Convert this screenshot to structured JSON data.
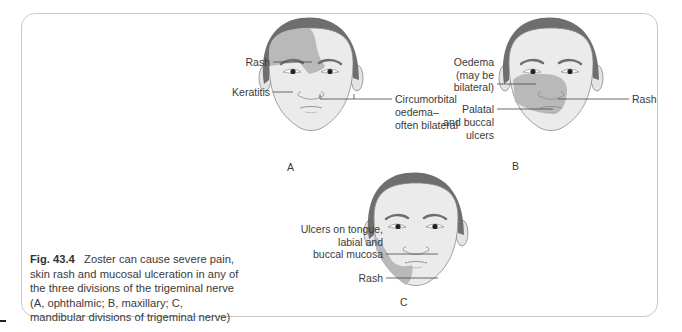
{
  "figure": {
    "number": "Fig. 43.4",
    "caption_text": "Zoster can cause severe pain, skin rash and mucosal ulceration in any of the three divisions of the trigeminal nerve (A, ophthalmic; B, maxillary; C, mandibular divisions of trigeminal nerve)",
    "colors": {
      "hair": "#6e6e6e",
      "skin": "#ebebec",
      "rash": "#b9b9ba",
      "outline": "#8a8a8a",
      "frame": "#c8c8c8"
    }
  },
  "panels": [
    {
      "letter": "A",
      "division": "ophthalmic",
      "labels": {
        "rash": "Rash",
        "keratitis": "Keratitis",
        "oedema_l1": "Circumorbital",
        "oedema_l2": "oedema–",
        "oedema_l3": "often bilateral"
      }
    },
    {
      "letter": "B",
      "division": "maxillary",
      "labels": {
        "oedema_l1": "Oedema",
        "oedema_l2": "(may be",
        "oedema_l3": "bilateral)",
        "ulcers_l1": "Palatal",
        "ulcers_l2": "and buccal",
        "ulcers_l3": "ulcers",
        "rash": "Rash"
      }
    },
    {
      "letter": "C",
      "division": "mandibular",
      "labels": {
        "ulcers_l1": "Ulcers on tongue,",
        "ulcers_l2": "labial and",
        "ulcers_l3": "buccal mucosa",
        "rash": "Rash"
      }
    }
  ]
}
